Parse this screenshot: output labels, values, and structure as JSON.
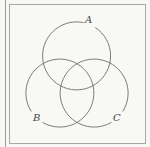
{
  "diagram": {
    "type": "venn",
    "sets": [
      {
        "label": "A",
        "cx": 77,
        "cy": 56,
        "r": 34,
        "label_x": 88,
        "label_y": 23
      },
      {
        "label": "B",
        "cx": 60,
        "cy": 93,
        "r": 34,
        "label_x": 34,
        "label_y": 121
      },
      {
        "label": "C",
        "cx": 94,
        "cy": 93,
        "r": 34,
        "label_x": 114,
        "label_y": 121
      }
    ],
    "stroke_color": "#6e6e6e",
    "background_color": "#f8f8f6"
  }
}
